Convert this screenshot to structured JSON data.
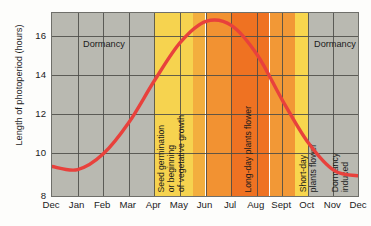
{
  "chart_data": {
    "type": "line",
    "title": "",
    "xlabel": "",
    "ylabel": "Length of photoperiod (hours)",
    "ylim": [
      8,
      16.8
    ],
    "yticks": [
      8,
      10,
      12,
      14,
      16
    ],
    "ytick_labels": [
      "8",
      "10",
      "12",
      "14",
      "16"
    ],
    "categories": [
      "Dec",
      "Jan",
      "Feb",
      "Mar",
      "Apr",
      "May",
      "Jun",
      "Jul",
      "Aug",
      "Sept",
      "Oct",
      "Nov",
      "Dec"
    ],
    "grid": true,
    "legend": "none",
    "series": [
      {
        "name": "Length of photoperiod",
        "color": "#e8413c",
        "x": [
          "Dec",
          "Jan",
          "Feb",
          "Mar",
          "Apr",
          "May",
          "Jun",
          "Jul",
          "Aug",
          "Sept",
          "Oct",
          "Nov",
          "Dec"
        ],
        "values": [
          9.5,
          9.35,
          10.1,
          11.6,
          13.6,
          15.4,
          16.4,
          16.2,
          14.8,
          12.6,
          10.6,
          9.3,
          9.05
        ]
      }
    ],
    "bands": [
      {
        "label": "Dormancy",
        "from": "Dec",
        "to": "Apr",
        "color": "#b9b9b1",
        "orientation": "horizontal"
      },
      {
        "label": "Seed germination\nor beginning\nof vegetative growth",
        "from": "Apr",
        "to": "May",
        "color": "#f6d34f",
        "orientation": "vertical"
      },
      {
        "label": "",
        "from": "May",
        "to": "Jun",
        "color": "#f29232",
        "orientation": "vertical"
      },
      {
        "label": "Long-day plants flower",
        "from": "Jun",
        "to": "Jul",
        "color": "#ef7222",
        "orientation": "vertical"
      },
      {
        "label": "",
        "from": "Jul",
        "to": "Aug",
        "color": "#f29836",
        "orientation": "vertical"
      },
      {
        "label": "Short-day\nplants flower",
        "from": "Aug",
        "to": "Sept",
        "color": "#f8d64e",
        "orientation": "vertical"
      },
      {
        "label": "Dormancy\ninduced",
        "from": "Sept",
        "to": "Oct",
        "color": "#f8d64e",
        "orientation": "vertical"
      },
      {
        "label": "Dormancy",
        "from": "Oct",
        "to": "Dec",
        "color": "#b9b9b1",
        "orientation": "horizontal"
      }
    ],
    "annotations": [
      {
        "text": "Dormancy",
        "position": "left-gray-band-top"
      },
      {
        "text": "Seed germination",
        "position": "apr-may-band"
      },
      {
        "text": "or beginning",
        "position": "apr-may-band"
      },
      {
        "text": "of vegetative growth",
        "position": "apr-may-band"
      },
      {
        "text": "Long-day plants flower",
        "position": "jun-jul-band"
      },
      {
        "text": "Short-day",
        "position": "aug-band"
      },
      {
        "text": "plants flower",
        "position": "aug-band"
      },
      {
        "text": "Dormancy",
        "position": "sept-band"
      },
      {
        "text": "induced",
        "position": "sept-band"
      },
      {
        "text": "Dormancy",
        "position": "right-gray-band-top"
      }
    ]
  },
  "axis": {
    "y_title": "Length of photoperiod (hours)",
    "y_tick_0": "8",
    "y_tick_1": "10",
    "y_tick_2": "12",
    "y_tick_3": "14",
    "y_tick_4": "16",
    "x_tick_0": "Dec",
    "x_tick_1": "Jan",
    "x_tick_2": "Feb",
    "x_tick_3": "Mar",
    "x_tick_4": "Apr",
    "x_tick_5": "May",
    "x_tick_6": "Jun",
    "x_tick_7": "Jul",
    "x_tick_8": "Aug",
    "x_tick_9": "Sept",
    "x_tick_10": "Oct",
    "x_tick_11": "Nov",
    "x_tick_12": "Dec"
  },
  "labels": {
    "dormancy_left": "Dormancy",
    "dormancy_right": "Dormancy",
    "seed_line1": "Seed germination",
    "seed_line2": "or beginning",
    "seed_line3": "of vegetative growth",
    "longday": "Long-day plants flower",
    "shortday_line1": "Short-day",
    "shortday_line2": "plants flower",
    "dormancy_induced_line1": "Dormancy",
    "dormancy_induced_line2": "induced"
  },
  "colors": {
    "curve": "#e8413c",
    "gray_band": "#b9b9b1",
    "yellow_band": "#f8d64e",
    "light_orange": "#f29232",
    "deep_orange": "#ef7222",
    "gridline": "#4a4a46",
    "frame": "#6f6f6a",
    "text": "#1b1b1b"
  }
}
